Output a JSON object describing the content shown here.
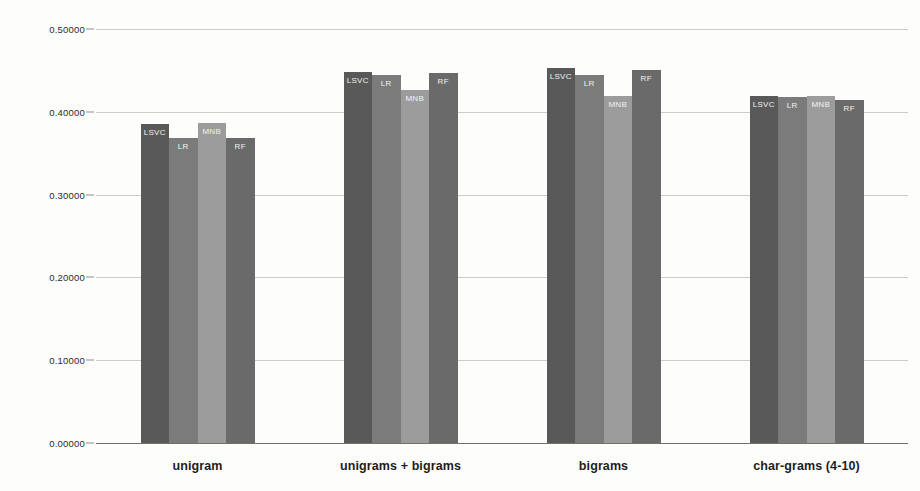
{
  "chart_data": {
    "type": "bar",
    "title": "",
    "subtitle": "",
    "xlabel": "",
    "ylabel": "",
    "ylim": [
      0.0,
      0.5
    ],
    "ytick_labels": [
      "0.50000",
      "0.40000",
      "0.30000",
      "0.20000",
      "0.10000",
      "0.00000"
    ],
    "ytick_values": [
      0.5,
      0.4,
      0.3,
      0.2,
      0.1,
      0.0
    ],
    "grid": true,
    "legend_position": "none",
    "categories": [
      "unigram",
      "unigrams + bigrams",
      "bigrams",
      "char-grams (4-10)"
    ],
    "series": [
      {
        "name": "LSVC",
        "color": "#595959",
        "values": [
          0.385,
          0.448,
          0.453,
          0.419
        ]
      },
      {
        "name": "LR",
        "color": "#7b7b7b",
        "values": [
          0.368,
          0.444,
          0.444,
          0.418
        ]
      },
      {
        "name": "MNB",
        "color": "#9c9c9c",
        "values": [
          0.386,
          0.426,
          0.419,
          0.419
        ]
      },
      {
        "name": "RF",
        "color": "#6a6a6a",
        "values": [
          0.368,
          0.447,
          0.45,
          0.414
        ]
      }
    ],
    "bar_labels": [
      "LSVC",
      "LR",
      "MNB",
      "RF"
    ],
    "gridline_color": "#c9cdc6",
    "axis_color": "#6e736c",
    "background_color": "#fdfdfc"
  }
}
